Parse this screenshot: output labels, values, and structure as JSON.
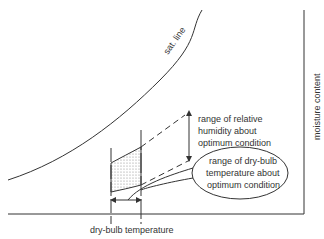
{
  "diagram": {
    "type": "psychrometric-sketch",
    "labels": {
      "sat_line": "sat. line",
      "y_axis": "moisture content",
      "x_axis": "dry-bulb temperature",
      "rh_range": [
        "range of relative",
        "humidity about",
        "optimum condition"
      ],
      "db_range": [
        "range of dry-bulb",
        "temperature about",
        "optimum condition"
      ]
    },
    "colors": {
      "ink": "#333333",
      "shade": "#9a9a9a",
      "background": "#ffffff"
    }
  }
}
